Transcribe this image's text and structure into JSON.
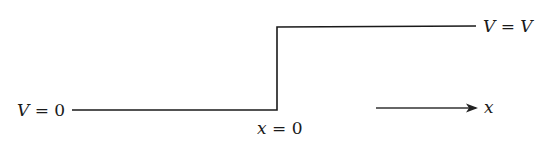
{
  "diagram": {
    "type": "step-potential",
    "labels": {
      "left_potential": {
        "var": "V",
        "eq": " = ",
        "val": "0"
      },
      "right_potential": {
        "var": "V",
        "eq": " = ",
        "val": "V"
      },
      "step_position": {
        "var": "x",
        "eq": " = ",
        "val": "0"
      },
      "axis": {
        "var": "x"
      }
    },
    "colors": {
      "ink": "#1a1a1a",
      "background": "#ffffff"
    }
  }
}
